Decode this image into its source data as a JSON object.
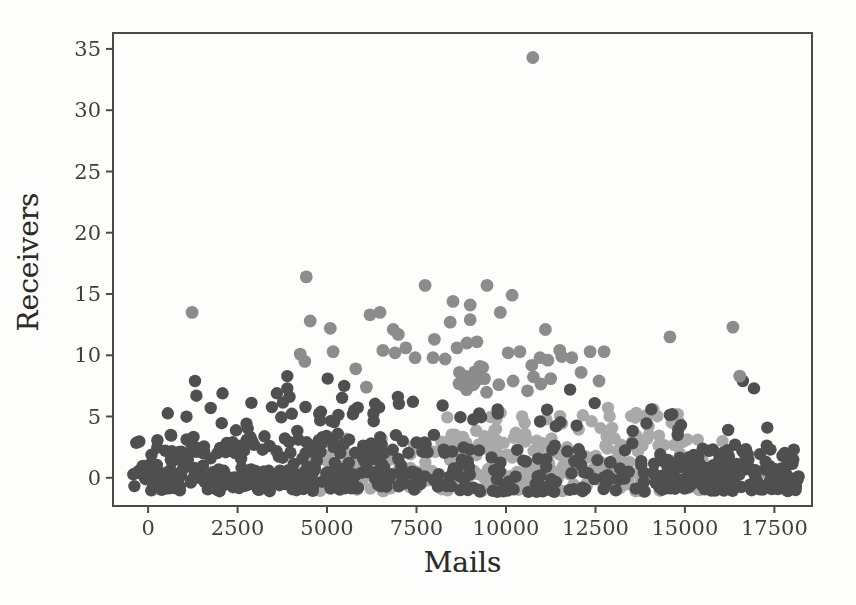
{
  "chart_data": {
    "type": "scatter",
    "title": "",
    "xlabel": "Mails",
    "ylabel": "Receivers",
    "x_ticks": [
      0,
      2500,
      5000,
      7500,
      10000,
      12500,
      15000,
      17500
    ],
    "y_ticks": [
      0,
      5,
      10,
      15,
      20,
      25,
      30,
      35
    ],
    "xlim": [
      -980,
      18550
    ],
    "ylim": [
      -2.3,
      36.3
    ],
    "grid": false,
    "legend": null,
    "seed": 7,
    "colors": {
      "background": "#fdfdfb",
      "spine": "#4a4a4a",
      "tick_label": "#3e3e3e",
      "axis_label": "#2b2b2b"
    },
    "series": [
      {
        "name": "light-gray-cluster",
        "color": "#a9a9a9",
        "marker_radius": 6.2,
        "clusters": [
          {
            "n": 170,
            "x": [
              4700,
              15600
            ],
            "y": [
              -1.1,
              0.6
            ],
            "pow": 1
          },
          {
            "n": 120,
            "x": [
              5500,
              15500
            ],
            "y": [
              0.3,
              3.3
            ],
            "pow": 1.6
          },
          {
            "n": 55,
            "x": [
              7800,
              15200
            ],
            "y": [
              2.6,
              5.2
            ],
            "pow": 1.4
          },
          {
            "n": 12,
            "x": [
              4300,
              5600
            ],
            "y": [
              0.0,
              2.0
            ],
            "pow": 1
          }
        ],
        "points": [
          [
            12850,
            5.7
          ],
          [
            13640,
            5.3
          ],
          [
            14120,
            5.6
          ],
          [
            13900,
            4.9
          ],
          [
            14630,
            4.5
          ],
          [
            12150,
            5.1
          ],
          [
            9850,
            5.3
          ],
          [
            10450,
            5.0
          ],
          [
            15950,
            1.4
          ],
          [
            16450,
            0.8
          ],
          [
            17150,
            0.4
          ],
          [
            15650,
            2.2
          ],
          [
            16050,
            3.0
          ]
        ]
      },
      {
        "name": "dark-gray-cluster",
        "color": "#4f4f4f",
        "marker_radius": 6.2,
        "clusters": [
          {
            "n": 160,
            "x": [
              -420,
              5800
            ],
            "y": [
              -1.1,
              0.6
            ],
            "pow": 1
          },
          {
            "n": 30,
            "x": [
              5800,
              8800
            ],
            "y": [
              -1.0,
              0.5
            ],
            "pow": 1
          },
          {
            "n": 110,
            "x": [
              -380,
              8600
            ],
            "y": [
              0.3,
              3.2
            ],
            "pow": 1.6
          },
          {
            "n": 70,
            "x": [
              250,
              8700
            ],
            "y": [
              2.0,
              5.3
            ],
            "pow": 1.8
          },
          {
            "n": 14,
            "x": [
              700,
              8500
            ],
            "y": [
              4.8,
              6.6
            ],
            "pow": 1
          },
          {
            "n": 70,
            "x": [
              8500,
              15200
            ],
            "y": [
              -0.9,
              2.3
            ],
            "pow": 1
          },
          {
            "n": 25,
            "x": [
              8500,
              14500
            ],
            "y": [
              -1.15,
              -0.85
            ],
            "pow": 1
          },
          {
            "n": 22,
            "x": [
              8700,
              14900
            ],
            "y": [
              2.3,
              5.6
            ],
            "pow": 1
          },
          {
            "n": 90,
            "x": [
              14400,
              17300
            ],
            "y": [
              -1.1,
              1.3
            ],
            "pow": 1
          },
          {
            "n": 40,
            "x": [
              17300,
              18250
            ],
            "y": [
              -1.1,
              0.2
            ],
            "pow": 1
          },
          {
            "n": 40,
            "x": [
              14500,
              18100
            ],
            "y": [
              0.6,
              2.8
            ],
            "pow": 1.5
          }
        ],
        "points": [
          [
            1310,
            7.9
          ],
          [
            1350,
            6.7
          ],
          [
            2080,
            6.9
          ],
          [
            3600,
            6.9
          ],
          [
            3890,
            8.3
          ],
          [
            3890,
            7.3
          ],
          [
            3950,
            6.6
          ],
          [
            5020,
            8.1
          ],
          [
            5480,
            7.5
          ],
          [
            6980,
            6.6
          ],
          [
            7400,
            6.2
          ],
          [
            8230,
            5.9
          ],
          [
            11790,
            7.2
          ],
          [
            12480,
            6.1
          ],
          [
            14890,
            4.3
          ],
          [
            16210,
            3.9
          ],
          [
            16400,
            2.7
          ],
          [
            16930,
            7.3
          ],
          [
            16620,
            7.9
          ],
          [
            17300,
            4.1
          ]
        ]
      },
      {
        "name": "medium-gray-cluster",
        "color": "#8c8c8c",
        "marker_radius": 6.4,
        "clusters": [
          {
            "n": 14,
            "x": [
              8500,
              11200
            ],
            "y": [
              6.8,
              9.3
            ],
            "pow": 1
          }
        ],
        "points": [
          [
            10750,
            34.3
          ],
          [
            1230,
            13.5
          ],
          [
            4420,
            16.4
          ],
          [
            4530,
            12.8
          ],
          [
            5090,
            12.2
          ],
          [
            5170,
            10.3
          ],
          [
            4250,
            10.1
          ],
          [
            4380,
            9.5
          ],
          [
            6200,
            13.3
          ],
          [
            7740,
            15.7
          ],
          [
            9470,
            15.7
          ],
          [
            10170,
            14.9
          ],
          [
            8520,
            14.4
          ],
          [
            9000,
            14.1
          ],
          [
            6480,
            13.5
          ],
          [
            9840,
            13.5
          ],
          [
            9000,
            12.9
          ],
          [
            8440,
            12.7
          ],
          [
            6850,
            12.1
          ],
          [
            6990,
            11.7
          ],
          [
            8910,
            11.0
          ],
          [
            9190,
            11.1
          ],
          [
            8630,
            10.6
          ],
          [
            6560,
            10.4
          ],
          [
            6900,
            10.2
          ],
          [
            10060,
            10.2
          ],
          [
            10390,
            10.3
          ],
          [
            7460,
            9.8
          ],
          [
            7960,
            9.8
          ],
          [
            10950,
            9.8
          ],
          [
            11170,
            9.6
          ],
          [
            11560,
            9.9
          ],
          [
            11840,
            9.8
          ],
          [
            9270,
            9.1
          ],
          [
            11100,
            12.1
          ],
          [
            11250,
            8.1
          ],
          [
            11500,
            10.4
          ],
          [
            12350,
            10.3
          ],
          [
            12740,
            10.3
          ],
          [
            12100,
            8.6
          ],
          [
            12600,
            7.9
          ],
          [
            14580,
            11.5
          ],
          [
            16340,
            12.3
          ],
          [
            16530,
            8.3
          ],
          [
            5800,
            8.9
          ],
          [
            6100,
            7.4
          ],
          [
            10600,
            7.1
          ],
          [
            9800,
            7.6
          ],
          [
            10200,
            7.9
          ],
          [
            9400,
            8.1
          ],
          [
            8900,
            7.2
          ],
          [
            8300,
            9.7
          ],
          [
            8000,
            11.3
          ],
          [
            8700,
            8.6
          ],
          [
            7200,
            10.6
          ]
        ]
      }
    ]
  }
}
